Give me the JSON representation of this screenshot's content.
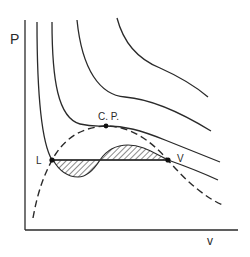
{
  "diagram": {
    "type": "pv-isotherm-diagram",
    "axis_labels": {
      "y": "P",
      "x": "v"
    },
    "point_labels": {
      "critical_point": "C. P.",
      "liquid": "L",
      "vapor": "V"
    },
    "elements": [
      {
        "kind": "isotherm",
        "count": 4,
        "style": "solid"
      },
      {
        "kind": "coexistence-curve",
        "style": "dashed"
      },
      {
        "kind": "tie-line",
        "from": "L",
        "to": "V"
      },
      {
        "kind": "equal-area-regions",
        "count": 2,
        "fill": "hatched"
      }
    ],
    "colors": {
      "line": "#2a2a2a",
      "background": "#ffffff"
    }
  }
}
